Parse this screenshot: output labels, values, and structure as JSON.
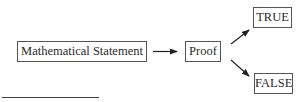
{
  "diagram": {
    "type": "flowchart",
    "nodes": [
      {
        "id": "statement",
        "label": "Mathematical Statement"
      },
      {
        "id": "proof",
        "label": "Proof"
      },
      {
        "id": "true",
        "label": "TRUE"
      },
      {
        "id": "false",
        "label": "FALSE"
      }
    ],
    "edges": [
      {
        "from": "statement",
        "to": "proof"
      },
      {
        "from": "proof",
        "to": "true"
      },
      {
        "from": "proof",
        "to": "false"
      }
    ],
    "colors": {
      "line": "#222222",
      "border": "#555555",
      "text": "#2a2a2a"
    }
  }
}
